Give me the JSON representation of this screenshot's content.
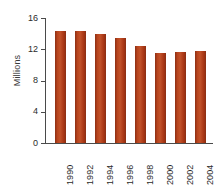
{
  "chart_data": {
    "type": "bar",
    "title": "",
    "subtitle": "",
    "xlabel": "",
    "ylabel": "Millions",
    "categories": [
      "1990",
      "1992",
      "1994",
      "1996",
      "1998",
      "2000",
      "2002",
      "2004"
    ],
    "values": [
      14.4,
      14.4,
      13.9,
      13.4,
      12.4,
      11.5,
      11.7,
      11.8
    ],
    "series": [
      {
        "name": "Millions",
        "values": [
          14.4,
          14.4,
          13.9,
          13.4,
          12.4,
          11.5,
          11.7,
          11.8
        ]
      }
    ],
    "ylim": [
      0,
      16
    ],
    "xlim_categories": 8,
    "y_ticks": [
      0,
      4,
      8,
      12,
      16
    ],
    "y_tick_labels": [
      "0",
      "4",
      "8",
      "12",
      "16"
    ],
    "grid": false,
    "legend": false,
    "legend_position": "none",
    "bar_color": "#b8441d",
    "axis_color": "#4a4a4a",
    "text_color": "#2b2b2b",
    "background_color": "#ffffff",
    "x_tick_label_rotation": 90,
    "ylabel_rotation": 90,
    "annotations": []
  }
}
